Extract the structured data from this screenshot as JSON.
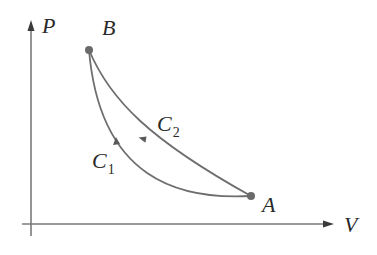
{
  "diagram": {
    "type": "pv-diagram",
    "axes": {
      "y_label": "P",
      "x_label": "V"
    },
    "points": [
      {
        "id": "B",
        "label": "B"
      },
      {
        "id": "A",
        "label": "A"
      }
    ],
    "curves": [
      {
        "id": "C1",
        "label": "C",
        "subscript": "1",
        "from": "A",
        "to": "B",
        "direction": "A to B (lower curve)"
      },
      {
        "id": "C2",
        "label": "C",
        "subscript": "2",
        "from": "B",
        "to": "A",
        "direction": "B to A (upper curve)"
      }
    ],
    "colors": {
      "curve": "#6e6e6e",
      "axis": "#7a7a7a",
      "point": "#6a6a6a",
      "text": "#2a2a2a"
    }
  }
}
